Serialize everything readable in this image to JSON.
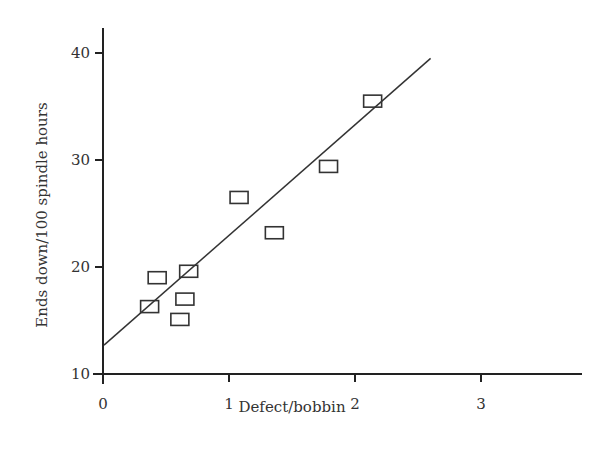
{
  "chart_data": {
    "type": "scatter",
    "title": "",
    "xlabel": "Defect/bobbin",
    "ylabel": "Ends down/100 spindle hours",
    "xlim": [
      0,
      3.8
    ],
    "ylim": [
      10,
      43
    ],
    "x_ticks": [
      0,
      1,
      2,
      3
    ],
    "y_ticks": [
      10,
      20,
      30,
      40
    ],
    "x_tick_labels": [
      "0",
      "1",
      "2",
      "3"
    ],
    "y_tick_labels": [
      "10",
      "20",
      "30",
      "40"
    ],
    "grid": false,
    "legend": null,
    "marker": "open-rectangle",
    "series": [
      {
        "name": "observations",
        "x": [
          0.37,
          0.43,
          0.68,
          0.65,
          0.61,
          1.08,
          1.36,
          1.79,
          2.14
        ],
        "y": [
          16.3,
          19.0,
          19.6,
          17.0,
          15.1,
          26.5,
          23.2,
          29.4,
          35.5
        ]
      }
    ],
    "fit_line": {
      "name": "regression-line",
      "x": [
        0,
        2.6
      ],
      "y": [
        12.7,
        39.5
      ]
    },
    "colors": {
      "axis": "#222222",
      "marker": "#333333",
      "line": "#333333"
    }
  },
  "labels": {
    "xlabel": "Defect/bobbin",
    "ylabel": "Ends down/100 spindle hours"
  }
}
